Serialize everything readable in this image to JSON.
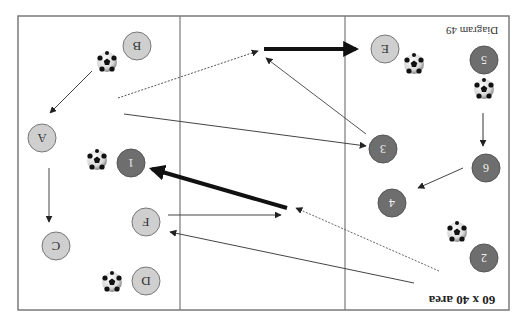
{
  "diagram": {
    "title": "Diagram 49",
    "area_label": "60 x 40 area",
    "orientation": "rotated-180",
    "colors": {
      "frame": "#7a7a7a",
      "light_player": "#cfcfcf",
      "dark_player": "#6e6e6e",
      "arrow": "#333333",
      "thick_arrow": "#111111"
    },
    "frame": {
      "x": 18,
      "y": 16,
      "w": 491,
      "h": 294
    },
    "dividers": [
      180,
      345
    ],
    "light_players": [
      {
        "id": "A",
        "x": 42,
        "y": 138
      },
      {
        "id": "B",
        "x": 137,
        "y": 46
      },
      {
        "id": "C",
        "x": 56,
        "y": 246
      },
      {
        "id": "D",
        "x": 146,
        "y": 281
      },
      {
        "id": "E",
        "x": 385,
        "y": 49
      },
      {
        "id": "F",
        "x": 146,
        "y": 222
      }
    ],
    "dark_players": [
      {
        "id": "1",
        "x": 131,
        "y": 163
      },
      {
        "id": "2",
        "x": 484,
        "y": 258
      },
      {
        "id": "3",
        "x": 383,
        "y": 149
      },
      {
        "id": "4",
        "x": 392,
        "y": 203
      },
      {
        "id": "5",
        "x": 484,
        "y": 60
      },
      {
        "id": "6",
        "x": 486,
        "y": 168
      }
    ],
    "balls": [
      {
        "x": 107,
        "y": 62
      },
      {
        "x": 97,
        "y": 160
      },
      {
        "x": 112,
        "y": 282
      },
      {
        "x": 414,
        "y": 64
      },
      {
        "x": 484,
        "y": 89
      },
      {
        "x": 457,
        "y": 232
      }
    ]
  }
}
